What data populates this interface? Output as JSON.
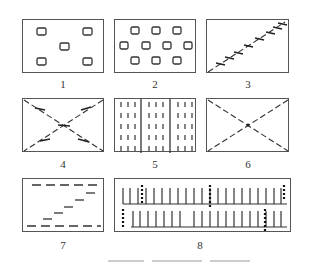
{
  "figure": {
    "panels": [
      {
        "id": "1",
        "label": "1",
        "pattern": "sparse-five-dot-rectangles",
        "items": 5
      },
      {
        "id": "2",
        "label": "2",
        "pattern": "three-row-staggered-rectangles",
        "items": 10
      },
      {
        "id": "3",
        "label": "3",
        "pattern": "single-diagonal-with-ticks"
      },
      {
        "id": "4",
        "label": "4",
        "pattern": "crossed-dashed-diagonals-with-ticks"
      },
      {
        "id": "5",
        "label": "5",
        "pattern": "vertical-dash-columns-three-sections"
      },
      {
        "id": "6",
        "label": "6",
        "pattern": "crossed-dashed-diagonals-plain"
      },
      {
        "id": "7",
        "label": "7",
        "pattern": "stepped-horizontal-dashes"
      },
      {
        "id": "8",
        "label": "8",
        "pattern": "two-rows-ladder-with-marks"
      }
    ],
    "caption": ""
  },
  "colors": {
    "stroke": "#333333",
    "frame": "#555555",
    "background": "#ffffff"
  }
}
